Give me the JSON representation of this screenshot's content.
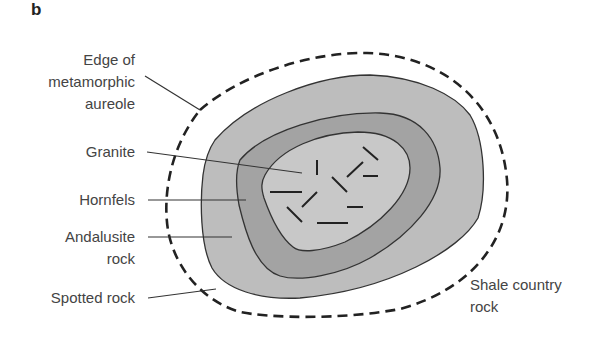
{
  "panel_letter": "b",
  "labels": {
    "edge_line1": "Edge of",
    "edge_line2": "metamorphic",
    "edge_line3": "aureole",
    "granite": "Granite",
    "hornfels": "Hornfels",
    "andalusite_line1": "Andalusite",
    "andalusite_line2": "rock",
    "spotted": "Spotted rock",
    "shale_line1": "Shale country",
    "shale_line2": "rock"
  },
  "colors": {
    "andalusite_fill": "#bdbdbd",
    "hornfels_fill": "#a3a3a3",
    "granite_fill": "#c8c8c8",
    "outline": "#333333",
    "text": "#444444"
  }
}
